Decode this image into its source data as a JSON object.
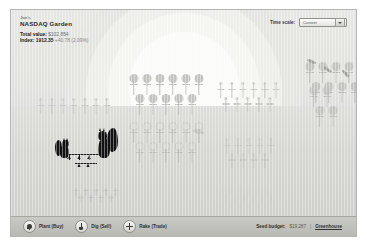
{
  "header": {
    "owner": "Joe's",
    "title": "NASDAQ Garden",
    "total_value_label": "Total value:",
    "total_value": "$102,854",
    "index_label": "Index:",
    "index_value": "1912.35",
    "index_change": "+40.78",
    "index_change_pct": "(2.09%)",
    "time_scale_label": "Time scale:",
    "time_scale_value": "Current"
  },
  "toolbar": {
    "plant_label": "Plant (Buy)",
    "dig_label": "Dig (Sell)",
    "rake_label": "Rake (Trade)",
    "budget_label": "Seed budget:",
    "budget_value": "$19,287",
    "separator": "|",
    "greenhouse_label": "Greenhouse"
  },
  "icons": {
    "plant": "seed-icon",
    "dig": "shovel-icon",
    "rake": "rake-icon",
    "dropdown": "chevron-down-icon"
  },
  "garden": {
    "clusters": [
      {
        "name": "cluster-left-seedlings",
        "kind": "seedling",
        "x": 24,
        "y": 88,
        "rows": [
          7,
          0
        ]
      },
      {
        "name": "cluster-center-mature",
        "kind": "mature",
        "x": 116,
        "y": 64,
        "rows": [
          6,
          5
        ]
      },
      {
        "name": "cluster-center-outline",
        "kind": "outline",
        "x": 116,
        "y": 112,
        "rows": [
          6,
          5
        ]
      },
      {
        "name": "cluster-right-seedlings",
        "kind": "seedling",
        "x": 204,
        "y": 72,
        "rows": [
          6,
          5
        ]
      },
      {
        "name": "cluster-far-right-mature",
        "kind": "mature",
        "x": 296,
        "y": 76,
        "rows": [
          2,
          2
        ]
      },
      {
        "name": "cluster-topright-mature",
        "kind": "mature",
        "x": 292,
        "y": 52,
        "rows": [
          6,
          6
        ]
      },
      {
        "name": "cluster-bottom-sprouts",
        "kind": "sprout",
        "x": 60,
        "y": 178,
        "rows": [
          5,
          4
        ]
      },
      {
        "name": "cluster-bottom-shoots",
        "kind": "shoot",
        "x": 206,
        "y": 176,
        "rows": [
          6,
          6,
          5
        ]
      },
      {
        "name": "cluster-right-low",
        "kind": "seedling",
        "x": 210,
        "y": 128,
        "rows": [
          5,
          4
        ]
      }
    ],
    "critters": [
      {
        "name": "squirrel-left",
        "x": 46,
        "y": 126
      },
      {
        "name": "squirrel-right",
        "x": 88,
        "y": 118
      }
    ],
    "seeds": [
      {
        "x": 296,
        "y": 50
      },
      {
        "x": 312,
        "y": 58
      },
      {
        "x": 330,
        "y": 62
      }
    ]
  }
}
